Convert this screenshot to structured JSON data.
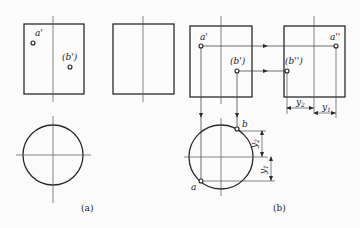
{
  "figure_a": {
    "caption": "(a)",
    "front_view": {
      "points": [
        {
          "label": "a'"
        },
        {
          "label": "(b')"
        }
      ]
    },
    "side_view": {},
    "top_view": {}
  },
  "figure_b": {
    "caption": "(b)",
    "front_view": {
      "points": [
        {
          "label": "a'"
        },
        {
          "label": "(b')"
        }
      ]
    },
    "side_view": {
      "points": [
        {
          "label": "a''"
        },
        {
          "label": "(b'')"
        }
      ]
    },
    "top_view": {
      "points": [
        {
          "label": "a"
        },
        {
          "label": "b"
        }
      ]
    },
    "dimensions": {
      "y1": {
        "base": "y",
        "sub": "1"
      },
      "y2": {
        "base": "y",
        "sub": "2"
      }
    }
  },
  "colors": {
    "line": "#2a2a2a",
    "thin": "#555555",
    "background": "#fbfbfb"
  }
}
